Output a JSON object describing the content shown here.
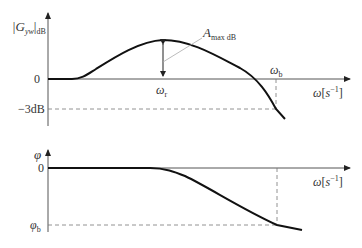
{
  "top_plot": {
    "y_label_main": "|G",
    "y_label_sub": "yw",
    "y_label_unit": "dB",
    "zero_label": "0",
    "minus3_label": "−3dB",
    "x_axis_label_var": "ω",
    "x_axis_label_unit_open": "[",
    "x_axis_label_unit": "s",
    "x_axis_label_exp": "−1",
    "x_axis_label_unit_close": "]",
    "omega_r_label": "ω",
    "omega_r_sub": "r",
    "omega_b_label": "ω",
    "omega_b_sub": "b",
    "amax_label": "A",
    "amax_sub": "max dB"
  },
  "bottom_plot": {
    "y_label": "φ",
    "zero_label": "0",
    "phi_b_label": "φ",
    "phi_b_sub": "b",
    "x_axis_label_var": "ω",
    "x_axis_label_unit_open": "[",
    "x_axis_label_unit": "s",
    "x_axis_label_exp": "−1",
    "x_axis_label_unit_close": "]"
  },
  "colors": {
    "axis": "#555555",
    "curve": "#111111",
    "dashed": "#777777",
    "leader": "#aaaaaa"
  }
}
